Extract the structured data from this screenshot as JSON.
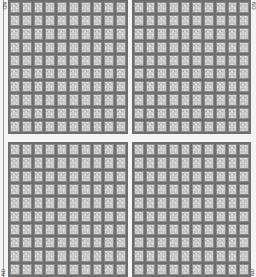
{
  "sheet": {
    "layout": "2x2 panels",
    "panels": [
      {
        "position": "top-left",
        "columns": 10,
        "rows": 10
      },
      {
        "position": "top-right",
        "columns": 10,
        "rows": 10
      },
      {
        "position": "bottom-left",
        "columns": 10,
        "rows": 10
      },
      {
        "position": "bottom-right",
        "columns": 10,
        "rows": 10
      }
    ],
    "corner_labels": {
      "top_left": "ND",
      "top_right": "NO",
      "bottom_left": "ND",
      "bottom_right": "ND"
    },
    "colors": {
      "cell_fill": "#c9c9c9",
      "grid_line": "#6e6e6e",
      "background": "#f4f4f4"
    }
  }
}
